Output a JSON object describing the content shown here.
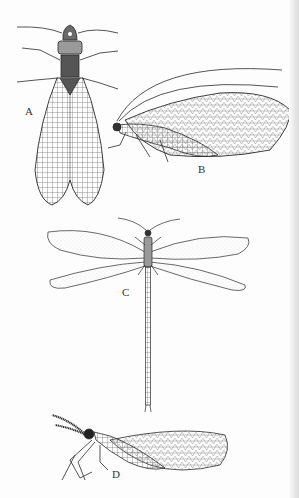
{
  "figure": {
    "labels": {
      "a": "A",
      "b": "B",
      "c": "C",
      "d": "D"
    },
    "specimens": [
      {
        "label": "A",
        "icon": "dobsonfly-icon",
        "view": "dorsal"
      },
      {
        "label": "B",
        "icon": "lacewing-icon",
        "view": "lateral"
      },
      {
        "label": "C",
        "icon": "antlion-icon",
        "view": "dorsal"
      },
      {
        "label": "D",
        "icon": "mantidfly-icon",
        "view": "lateral"
      }
    ],
    "colors": {
      "ink": "#2a2a2a",
      "paper": "#fdfdfd",
      "shadow": "#dcdcdc"
    }
  }
}
